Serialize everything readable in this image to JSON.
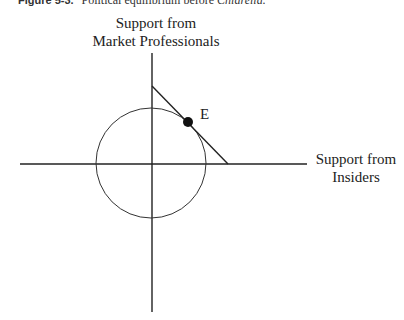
{
  "caption": {
    "figure_label": "Figure 5-3.",
    "title_prefix": "Political equilibrium before ",
    "title_italic": "Chiarella."
  },
  "axes": {
    "y_label_line1": "Support from",
    "y_label_line2": "Market Professionals",
    "x_label_line1": "Support from",
    "x_label_line2": "Insiders"
  },
  "point": {
    "label": "E"
  },
  "colors": {
    "line": "#222222",
    "background": "#ffffff"
  }
}
